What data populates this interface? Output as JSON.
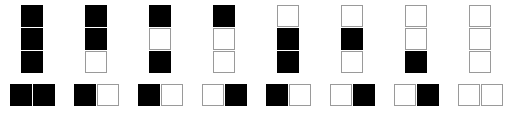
{
  "figure": {
    "colors": {
      "filled": "#000000",
      "empty": "#ffffff",
      "empty_border": "#9a9a9a",
      "background": "#ffffff"
    },
    "cell_states": {
      "filled": "filled",
      "empty": "empty"
    },
    "cell_size_px": 22
  },
  "chart_data": {
    "type": "heatmap",
    "xlabel": "",
    "ylabel": "",
    "grid": false,
    "legend": "none",
    "rows": 3,
    "columns": 8,
    "encoding": {
      "1": "filled",
      "0": "empty"
    },
    "stacks": {
      "label": "three-cell vertical stacks",
      "cells_per_group": 3,
      "group_count": 8,
      "values": [
        [
          1,
          1,
          1
        ],
        [
          1,
          1,
          0
        ],
        [
          1,
          0,
          1
        ],
        [
          1,
          0,
          0
        ],
        [
          0,
          1,
          1
        ],
        [
          0,
          1,
          0
        ],
        [
          0,
          0,
          1
        ],
        [
          0,
          0,
          0
        ]
      ],
      "decimal": [
        7,
        6,
        5,
        4,
        3,
        2,
        1,
        0
      ]
    },
    "pairs": {
      "label": "two-cell horizontal pairs",
      "cells_per_group": 2,
      "group_count": 8,
      "values": [
        [
          1,
          1
        ],
        [
          1,
          0
        ],
        [
          1,
          0
        ],
        [
          0,
          1
        ],
        [
          1,
          0
        ],
        [
          0,
          1
        ],
        [
          0,
          1
        ],
        [
          0,
          0
        ]
      ],
      "decimal": [
        3,
        2,
        2,
        1,
        2,
        1,
        1,
        0
      ]
    }
  }
}
